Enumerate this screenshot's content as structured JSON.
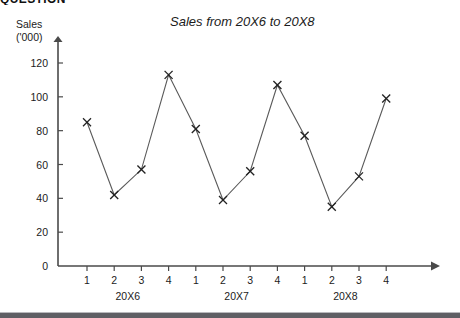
{
  "page": {
    "top_heading_partial": "QUESTION",
    "bottom_rule_color": "#5f5f64"
  },
  "chart_data": {
    "type": "line",
    "title": "Sales from 20X6 to 20X8",
    "ylabel_line1": "Sales",
    "ylabel_line2": "('000)",
    "xlabel": "",
    "ylim": [
      0,
      130
    ],
    "yticks": [
      0,
      20,
      40,
      60,
      80,
      100,
      120
    ],
    "ytick_labels": [
      "0",
      "20",
      "40",
      "60",
      "80",
      "100",
      "120"
    ],
    "grid": false,
    "legend": "none",
    "marker": "x",
    "line_color": "#5a5a5a",
    "marker_color": "#222222",
    "categories": [
      "1",
      "2",
      "3",
      "4",
      "1",
      "2",
      "3",
      "4",
      "1",
      "2",
      "3",
      "4"
    ],
    "groups": [
      {
        "label": "20X6",
        "quarters": [
          "1",
          "2",
          "3",
          "4"
        ],
        "values": [
          85,
          42,
          57,
          113
        ]
      },
      {
        "label": "20X7",
        "quarters": [
          "1",
          "2",
          "3",
          "4"
        ],
        "values": [
          81,
          39,
          56,
          107
        ]
      },
      {
        "label": "20X8",
        "quarters": [
          "1",
          "2",
          "3",
          "4"
        ],
        "values": [
          77,
          35,
          53,
          99
        ]
      }
    ],
    "values": [
      85,
      42,
      57,
      113,
      81,
      39,
      56,
      107,
      77,
      35,
      53,
      99
    ],
    "group_labels": [
      "20X6",
      "20X7",
      "20X8"
    ]
  }
}
